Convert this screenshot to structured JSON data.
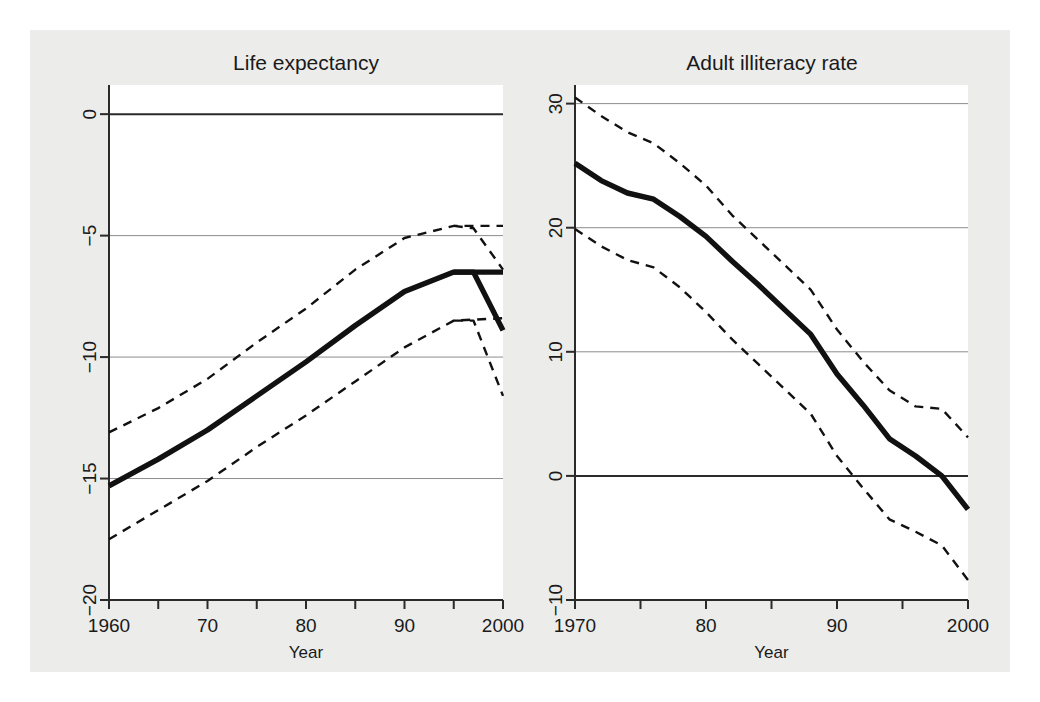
{
  "figure": {
    "background_color": "#ffffff",
    "paper_color": "#ececeb",
    "plot_background_color": "#ffffff",
    "line_color": "#111111",
    "grid_color": "#8c8c8c",
    "axis_color": "#2a2a2a"
  },
  "chart_data": [
    {
      "type": "line",
      "title": "Life expectancy",
      "xlabel": "Year",
      "ylabel": "",
      "xlim": [
        1960,
        2000
      ],
      "ylim": [
        -20,
        1.2
      ],
      "xticks": [
        1960,
        1965,
        1970,
        1975,
        1980,
        1985,
        1990,
        1995,
        2000
      ],
      "xticklabels": [
        "1960",
        "",
        "70",
        "",
        "80",
        "",
        "90",
        "",
        "2000"
      ],
      "yticks": [
        0,
        -5,
        -10,
        -15,
        -20
      ],
      "yticklabels": [
        "0",
        "-5",
        "-10",
        "-15",
        "-20"
      ],
      "grid": true,
      "zero_line": 0,
      "series": [
        {
          "name": "estimate",
          "style": "solid",
          "x": [
            1960,
            1965,
            1970,
            1975,
            1980,
            1985,
            1990,
            1995,
            2000
          ],
          "values": [
            -15.3,
            -14.2,
            -13.0,
            -11.6,
            -10.2,
            -8.7,
            -7.3,
            -6.5,
            -6.5
          ]
        },
        {
          "name": "upper confidence bound",
          "style": "dashed",
          "x": [
            1960,
            1965,
            1970,
            1975,
            1980,
            1985,
            1990,
            1995,
            2000
          ],
          "values": [
            -13.1,
            -12.1,
            -10.9,
            -9.4,
            -8.0,
            -6.4,
            -5.1,
            -4.6,
            -4.6
          ]
        },
        {
          "name": "lower confidence bound",
          "style": "dashed",
          "x": [
            1960,
            1965,
            1970,
            1975,
            1980,
            1985,
            1990,
            1995,
            2000
          ],
          "values": [
            -17.5,
            -16.3,
            -15.1,
            -13.7,
            -12.4,
            -11.0,
            -9.6,
            -8.5,
            -8.4
          ]
        }
      ],
      "series_extra": [
        {
          "name": "estimate_tail",
          "style": "solid",
          "x": [
            1995,
            1997,
            2000
          ],
          "values": [
            -6.5,
            -6.5,
            -8.9
          ]
        },
        {
          "name": "upper_tail",
          "style": "dashed",
          "x": [
            1995,
            1997,
            2000
          ],
          "values": [
            -4.6,
            -4.7,
            -6.4
          ]
        },
        {
          "name": "lower_tail",
          "style": "dashed",
          "x": [
            1995,
            1997,
            2000
          ],
          "values": [
            -8.5,
            -8.5,
            -11.6
          ]
        }
      ]
    },
    {
      "type": "line",
      "title": "Adult illiteracy rate",
      "xlabel": "Year",
      "ylabel": "",
      "xlim": [
        1970,
        2000
      ],
      "ylim": [
        -10,
        31.5
      ],
      "xticks": [
        1970,
        1975,
        1980,
        1985,
        1990,
        1995,
        2000
      ],
      "xticklabels": [
        "1970",
        "",
        "80",
        "",
        "90",
        "",
        "2000"
      ],
      "yticks": [
        30,
        20,
        10,
        0,
        -10
      ],
      "yticklabels": [
        "30",
        "20",
        "10",
        "0",
        "-10"
      ],
      "grid": true,
      "zero_line": 0,
      "series": [
        {
          "name": "estimate",
          "style": "solid",
          "x": [
            1970,
            1972,
            1974,
            1976,
            1978,
            1980,
            1982,
            1984,
            1986,
            1988,
            1990,
            1992,
            1994,
            1996,
            1998,
            2000
          ],
          "values": [
            25.2,
            23.8,
            22.8,
            22.3,
            20.9,
            19.3,
            17.3,
            15.4,
            13.4,
            11.4,
            8.2,
            5.7,
            3.0,
            1.6,
            0.0,
            -2.7
          ]
        },
        {
          "name": "upper confidence bound",
          "style": "dashed",
          "x": [
            1970,
            1972,
            1974,
            1976,
            1978,
            1980,
            1982,
            1984,
            1986,
            1988,
            1990,
            1992,
            1994,
            1996,
            1998,
            2000
          ],
          "values": [
            30.5,
            29.0,
            27.7,
            26.8,
            25.2,
            23.4,
            21.0,
            19.0,
            17.0,
            15.0,
            11.8,
            9.2,
            6.9,
            5.6,
            5.4,
            3.1
          ]
        },
        {
          "name": "lower confidence bound",
          "style": "dashed",
          "x": [
            1970,
            1972,
            1974,
            1976,
            1978,
            1980,
            1982,
            1984,
            1986,
            1988,
            1990,
            1992,
            1994,
            1996,
            1998,
            2000
          ],
          "values": [
            19.9,
            18.5,
            17.4,
            16.8,
            15.2,
            13.2,
            11.0,
            9.0,
            7.0,
            5.0,
            1.6,
            -1.0,
            -3.5,
            -4.5,
            -5.6,
            -8.4
          ]
        }
      ]
    }
  ]
}
